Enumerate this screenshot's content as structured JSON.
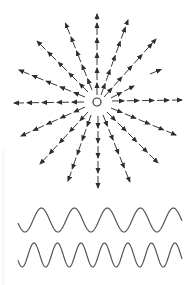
{
  "figure": {
    "colors": {
      "ink": "#3a3a3a",
      "wave": "#555555",
      "background": "#ffffff"
    },
    "source": {
      "cx": 97,
      "cy": 102,
      "r": 4
    },
    "rays": [
      {
        "name": "ray-up",
        "x1": 97,
        "y1": 95,
        "x2": 97,
        "y2": 14
      },
      {
        "name": "ray-up-right-1",
        "x1": 101,
        "y1": 95,
        "x2": 128,
        "y2": 20
      },
      {
        "name": "ray-up-right-2",
        "x1": 104,
        "y1": 97,
        "x2": 156,
        "y2": 39
      },
      {
        "name": "ray-up-right-3",
        "x1": 111,
        "y1": 98,
        "x2": 134,
        "y2": 86
      },
      {
        "name": "ray-right",
        "x1": 112,
        "y1": 101,
        "x2": 182,
        "y2": 100
      },
      {
        "name": "ray-down-right-1",
        "x1": 111,
        "y1": 108,
        "x2": 176,
        "y2": 135
      },
      {
        "name": "ray-down-right-2",
        "x1": 107,
        "y1": 112,
        "x2": 158,
        "y2": 163
      },
      {
        "name": "ray-down-right-3",
        "x1": 103,
        "y1": 115,
        "x2": 130,
        "y2": 182
      },
      {
        "name": "ray-down",
        "x1": 98,
        "y1": 116,
        "x2": 98,
        "y2": 188
      },
      {
        "name": "ray-down-left-1",
        "x1": 91,
        "y1": 115,
        "x2": 68,
        "y2": 181
      },
      {
        "name": "ray-down-left-2",
        "x1": 88,
        "y1": 112,
        "x2": 40,
        "y2": 164
      },
      {
        "name": "ray-down-left-3",
        "x1": 85,
        "y1": 107,
        "x2": 21,
        "y2": 136
      },
      {
        "name": "ray-left",
        "x1": 84,
        "y1": 102,
        "x2": 14,
        "y2": 103
      },
      {
        "name": "ray-up-left-1",
        "x1": 85,
        "y1": 97,
        "x2": 19,
        "y2": 70
      },
      {
        "name": "ray-up-left-2",
        "x1": 88,
        "y1": 92,
        "x2": 37,
        "y2": 41
      },
      {
        "name": "ray-up-left-3",
        "x1": 92,
        "y1": 90,
        "x2": 65,
        "y2": 22
      },
      {
        "name": "ray-isolated-right",
        "x1": 150,
        "y1": 74,
        "x2": 165,
        "y2": 68
      }
    ],
    "waves": [
      {
        "name": "wave-low-frequency",
        "x_start": 18,
        "x_end": 182,
        "center_y": 220,
        "amplitude": 12,
        "period": 33,
        "phase": 3.4
      },
      {
        "name": "wave-high-frequency",
        "x_start": 18,
        "x_end": 182,
        "center_y": 255,
        "amplitude": 12,
        "period": 23.5,
        "phase": 3.6
      }
    ]
  }
}
